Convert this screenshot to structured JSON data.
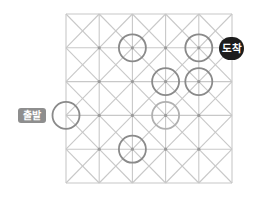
{
  "diagram": {
    "type": "grid-path-puzzle",
    "grid": {
      "cols": 5,
      "rows": 5,
      "origin": [
        66,
        14
      ],
      "cell_w": 33.2,
      "cell_h": 33.8,
      "line_color": "#c8c8c8",
      "diagonals": true,
      "node_dot_color": "#9a9a9a"
    },
    "start": {
      "label": "출발",
      "node": [
        0,
        3
      ],
      "color": "#8e8e8e"
    },
    "end": {
      "label": "도착",
      "node": [
        4,
        1
      ],
      "color": "#1c1c1c"
    },
    "circles": [
      {
        "node": [
          0,
          3
        ],
        "stroke": "#8a8a8a"
      },
      {
        "node": [
          2,
          1
        ],
        "stroke": "#8a8a8a"
      },
      {
        "node": [
          4,
          1
        ],
        "stroke": "#8a8a8a"
      },
      {
        "node": [
          3,
          2
        ],
        "stroke": "#8a8a8a"
      },
      {
        "node": [
          4,
          2
        ],
        "stroke": "#8a8a8a"
      },
      {
        "node": [
          3,
          3
        ],
        "stroke": "#b0b0b0"
      },
      {
        "node": [
          2,
          4
        ],
        "stroke": "#8a8a8a"
      }
    ],
    "circle_radius": 13.5
  }
}
